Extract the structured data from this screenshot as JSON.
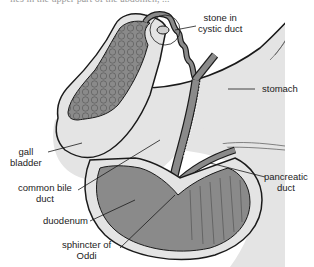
{
  "caption": {
    "text": "lies in the upper part of the abdomen, ..."
  },
  "diagram": {
    "colors": {
      "organ_light": "#e4e4e4",
      "organ_dark": "#8a8a8a",
      "outline": "#1a1a1a",
      "background": "#ffffff"
    },
    "labels": {
      "stone": {
        "line1": "stone in",
        "line2": "cystic duct"
      },
      "stomach": {
        "line1": "stomach"
      },
      "gall_bladder": {
        "line1": "gall",
        "line2": "bladder"
      },
      "common_bile_duct": {
        "line1": "common bile",
        "line2": "duct"
      },
      "pancreatic_duct": {
        "line1": "pancreatic",
        "line2": "duct"
      },
      "duodenum": {
        "line1": "duodenum"
      },
      "sphincter": {
        "line1": "sphincter of",
        "line2": "Oddi"
      }
    }
  }
}
